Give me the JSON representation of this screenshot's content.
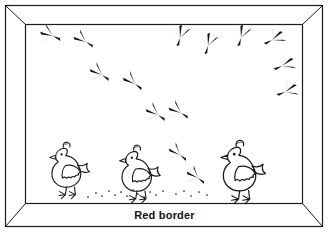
{
  "figure": {
    "caption": "Red border",
    "background_color": "#ffffff",
    "line_color": "#1a1a1a",
    "fill_color": "#ffffff"
  },
  "frame": {
    "name": "picture-frame",
    "style": "mitered-corner rectangular frame",
    "outer": {
      "x": 5,
      "y": 5,
      "width": 318,
      "height": 222
    },
    "inner": {
      "x": 25,
      "y": 24,
      "width": 278,
      "height": 180
    },
    "rail_label_position": "bottom"
  },
  "chickens": [
    {
      "id": "chicken-left",
      "label": "chicken 1",
      "x": 48,
      "y": 140,
      "scale": 1.0,
      "facing": "left"
    },
    {
      "id": "chicken-middle",
      "label": "chicken 2",
      "x": 118,
      "y": 143,
      "scale": 1.02,
      "facing": "left"
    },
    {
      "id": "chicken-right",
      "label": "chicken 3",
      "x": 219,
      "y": 138,
      "scale": 1.12,
      "facing": "left"
    }
  ],
  "footprints": [
    {
      "id": "print-1",
      "x": 53,
      "y": 36,
      "rotation": 20,
      "scale": 1.0
    },
    {
      "id": "print-2",
      "x": 86,
      "y": 42,
      "rotation": 25,
      "scale": 1.0
    },
    {
      "id": "print-3",
      "x": 102,
      "y": 75,
      "rotation": 28,
      "scale": 1.0
    },
    {
      "id": "print-4",
      "x": 135,
      "y": 84,
      "rotation": 30,
      "scale": 1.0
    },
    {
      "id": "print-5",
      "x": 158,
      "y": 115,
      "rotation": 28,
      "scale": 1.0
    },
    {
      "id": "print-6",
      "x": 181,
      "y": 113,
      "rotation": 26,
      "scale": 1.0
    },
    {
      "id": "print-7",
      "x": 180,
      "y": 155,
      "rotation": 32,
      "scale": 0.95
    },
    {
      "id": "print-8",
      "x": 198,
      "y": 178,
      "rotation": 32,
      "scale": 0.95
    },
    {
      "id": "print-9",
      "x": 180,
      "y": 38,
      "rotation": 100,
      "scale": 1.0
    },
    {
      "id": "print-10",
      "x": 208,
      "y": 46,
      "rotation": 100,
      "scale": 1.0
    },
    {
      "id": "print-11",
      "x": 241,
      "y": 38,
      "rotation": 100,
      "scale": 1.0
    },
    {
      "id": "print-12",
      "x": 272,
      "y": 40,
      "rotation": 145,
      "scale": 1.0
    },
    {
      "id": "print-13",
      "x": 282,
      "y": 66,
      "rotation": 150,
      "scale": 1.0
    },
    {
      "id": "print-14",
      "x": 285,
      "y": 92,
      "rotation": 152,
      "scale": 1.0
    }
  ],
  "ground_seeds": [
    {
      "x": 96,
      "y": 193
    },
    {
      "x": 102,
      "y": 196
    },
    {
      "x": 109,
      "y": 191
    },
    {
      "x": 115,
      "y": 195
    },
    {
      "x": 121,
      "y": 192
    },
    {
      "x": 127,
      "y": 196
    },
    {
      "x": 133,
      "y": 190
    },
    {
      "x": 138,
      "y": 194
    },
    {
      "x": 144,
      "y": 197
    },
    {
      "x": 150,
      "y": 192
    },
    {
      "x": 156,
      "y": 195
    },
    {
      "x": 163,
      "y": 191
    },
    {
      "x": 176,
      "y": 194
    },
    {
      "x": 184,
      "y": 191
    },
    {
      "x": 191,
      "y": 196
    },
    {
      "x": 199,
      "y": 192
    },
    {
      "x": 207,
      "y": 195
    },
    {
      "x": 88,
      "y": 197
    }
  ]
}
